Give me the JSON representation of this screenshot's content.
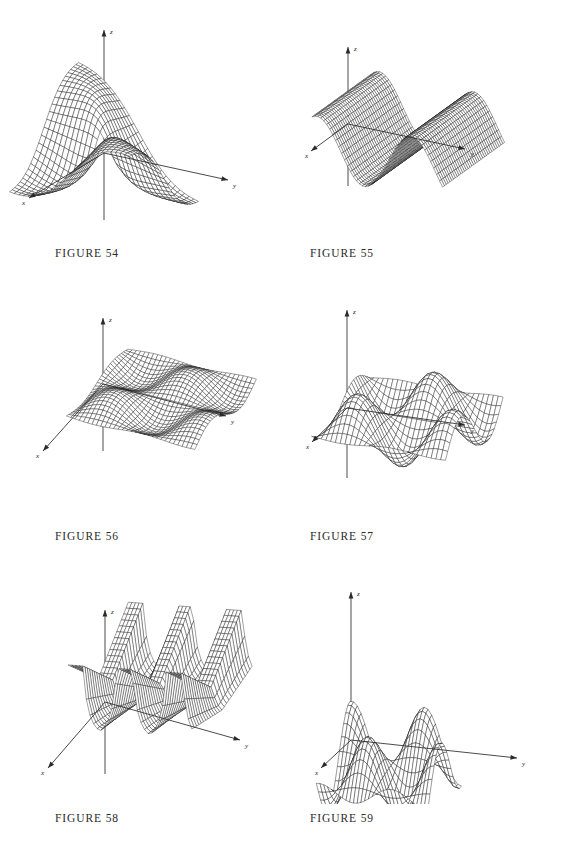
{
  "page": {
    "background": "#ffffff",
    "ink": "#111111",
    "width": 570,
    "height": 846,
    "columns": 2,
    "rows": 3
  },
  "figures": [
    {
      "id": "fig54",
      "caption": "FIGURE 54",
      "axis_labels": {
        "x": "x",
        "y": "y",
        "z": "z"
      },
      "surface_kind": "saddle-ridge-blowup",
      "mesh": {
        "nu": 30,
        "nv": 30,
        "style": "wireframe"
      }
    },
    {
      "id": "fig55",
      "caption": "FIGURE 55",
      "axis_labels": {
        "x": "x",
        "y": "y",
        "z": "z"
      },
      "surface_kind": "sine-ridges-along-x",
      "mesh": {
        "nu": 46,
        "nv": 46,
        "style": "wireframe-dense"
      }
    },
    {
      "id": "fig56",
      "caption": "FIGURE 56",
      "axis_labels": {
        "x": "x",
        "y": "y",
        "z": "z"
      },
      "surface_kind": "low-amplitude-eggcrate",
      "mesh": {
        "nu": 34,
        "nv": 34,
        "style": "wireframe"
      }
    },
    {
      "id": "fig57",
      "caption": "FIGURE 57",
      "axis_labels": {
        "x": "x",
        "y": "y",
        "z": "z"
      },
      "surface_kind": "large-eggcrate-waves",
      "mesh": {
        "nu": 32,
        "nv": 32,
        "style": "wireframe"
      }
    },
    {
      "id": "fig58",
      "caption": "FIGURE 58",
      "axis_labels": {
        "x": "x",
        "y": "y",
        "z": "z"
      },
      "surface_kind": "tangent-spikes-valleys",
      "mesh": {
        "nu": 34,
        "nv": 34,
        "style": "wireframe"
      }
    },
    {
      "id": "fig59",
      "caption": "FIGURE 59",
      "axis_labels": {
        "x": "x",
        "y": "y",
        "z": "z"
      },
      "surface_kind": "eggcrate-tall-ripples",
      "mesh": {
        "nu": 30,
        "nv": 30,
        "style": "wireframe"
      }
    }
  ],
  "chart_data": [
    {
      "type": "surface",
      "id": "fig54",
      "title": "FIGURE 54",
      "xlabel": "x",
      "ylabel": "y",
      "zlabel": "z",
      "function": "z = x*y/(x^2+y^2) style saddle with divergent ridges",
      "xlim": [
        -3.0,
        3.0
      ],
      "ylim": [
        -3.0,
        3.0
      ],
      "zlim": [
        -3.2,
        3.2
      ],
      "grid": true,
      "legend": "none"
    },
    {
      "type": "surface",
      "id": "fig55",
      "title": "FIGURE 55",
      "xlabel": "x",
      "ylabel": "y",
      "zlabel": "z",
      "function": "z = cos(y)",
      "xlim": [
        -3.2,
        3.2
      ],
      "ylim": [
        -6.5,
        6.5
      ],
      "zlim": [
        -1.2,
        1.2
      ],
      "grid": true,
      "legend": "none"
    },
    {
      "type": "surface",
      "id": "fig56",
      "title": "FIGURE 56",
      "xlabel": "x",
      "ylabel": "y",
      "zlabel": "z",
      "function": "z = 0.25*sin(x)*sin(y)",
      "xlim": [
        -6.3,
        6.3
      ],
      "ylim": [
        -6.3,
        6.3
      ],
      "zlim": [
        -0.5,
        0.5
      ],
      "grid": true,
      "legend": "none"
    },
    {
      "type": "surface",
      "id": "fig57",
      "title": "FIGURE 57",
      "xlabel": "x",
      "ylabel": "y",
      "zlabel": "z",
      "function": "z = sin(x)*sin(y) large amplitude",
      "xlim": [
        -6.3,
        6.3
      ],
      "ylim": [
        -6.3,
        6.3
      ],
      "zlim": [
        -1.6,
        1.6
      ],
      "grid": true,
      "legend": "none"
    },
    {
      "type": "surface",
      "id": "fig58",
      "title": "FIGURE 58",
      "xlabel": "x",
      "ylabel": "y",
      "zlabel": "z",
      "function": "z = tan-like spikes, ridged valleys periodic in y",
      "xlim": [
        -3.2,
        3.2
      ],
      "ylim": [
        -6.5,
        6.5
      ],
      "zlim": [
        0.0,
        3.4
      ],
      "grid": true,
      "legend": "none"
    },
    {
      "type": "surface",
      "id": "fig59",
      "title": "FIGURE 59",
      "xlabel": "x",
      "ylabel": "y",
      "zlabel": "z",
      "function": "z = cos(x)*cos(y) tall egg-crate ripples",
      "xlim": [
        -4.8,
        4.8
      ],
      "ylim": [
        -9.5,
        9.5
      ],
      "zlim": [
        -1.1,
        1.1
      ],
      "grid": true,
      "legend": "none"
    }
  ]
}
